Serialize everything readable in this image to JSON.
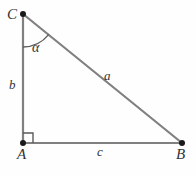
{
  "figure": {
    "kind": "right-triangle-diagram",
    "background_color": "#fefefe",
    "line_color": "#808080",
    "vertex_color": "#1a1a1a",
    "label_color": "#333333",
    "vertices": {
      "C": {
        "label": "C",
        "x": 23,
        "y": 14
      },
      "A": {
        "label": "A",
        "x": 23,
        "y": 143
      },
      "B": {
        "label": "B",
        "x": 182,
        "y": 143
      }
    },
    "sides": {
      "a": {
        "label": "a",
        "from": "C",
        "to": "B",
        "role": "hypotenuse"
      },
      "b": {
        "label": "b",
        "from": "C",
        "to": "A",
        "role": "vertical-leg"
      },
      "c": {
        "label": "c",
        "from": "A",
        "to": "B",
        "role": "horizontal-leg"
      }
    },
    "angles": {
      "alpha": {
        "label": "α",
        "at_vertex": "C"
      },
      "right_angle": {
        "label": "",
        "at_vertex": "A",
        "marker": "square"
      }
    }
  }
}
